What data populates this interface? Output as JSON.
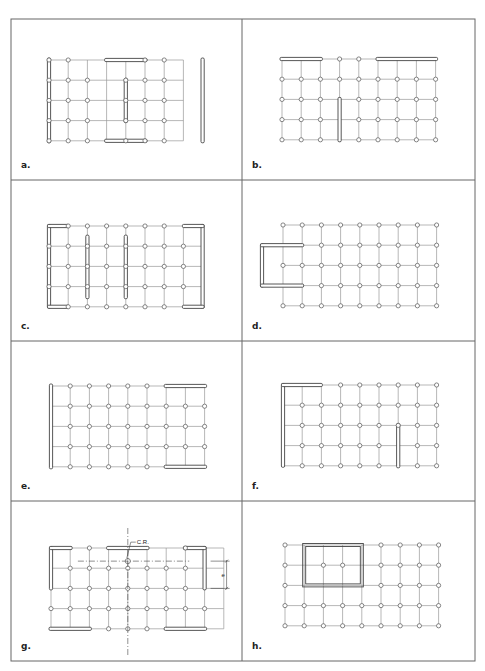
{
  "figure": {
    "border_color": "#666666",
    "grid_color": "#9a9a9a",
    "wall_color": "#444444",
    "outer": {
      "x": 11,
      "y": 19,
      "w": 464,
      "h": 642
    },
    "dividers": {
      "vertical_x": 242,
      "horizontal_y": [
        180,
        341,
        501
      ]
    },
    "grid": {
      "cols": 9,
      "rows": 5,
      "dx": 19.2,
      "dy": 20.2
    },
    "panels": [
      {
        "id": "a",
        "label": "a.",
        "x": 11,
        "y": 19,
        "w": 231,
        "h": 161,
        "origin": {
          "x": 38,
          "y": 41
        },
        "columns": [
          [
            1,
            1,
            0,
            0,
            0,
            1,
            1,
            0
          ],
          [
            1,
            1,
            1,
            0,
            1,
            1,
            1,
            0
          ],
          [
            1,
            1,
            1,
            0,
            1,
            1,
            1,
            0
          ],
          [
            1,
            1,
            1,
            0,
            1,
            1,
            1,
            0
          ],
          [
            1,
            1,
            1,
            0,
            1,
            1,
            1,
            0
          ]
        ],
        "grid_cols": 8,
        "walls": [
          {
            "type": "v",
            "c": 0,
            "r0": 0,
            "r1": 4
          },
          {
            "type": "v",
            "c": 8,
            "r0": 0,
            "r1": 4
          },
          {
            "type": "h",
            "r": 0,
            "c0": 3,
            "c1": 5
          },
          {
            "type": "h",
            "r": 4,
            "c0": 3,
            "c1": 5
          },
          {
            "type": "v",
            "c": 4,
            "r0": 1,
            "r1": 3
          }
        ],
        "grid_offset_c": 0
      },
      {
        "id": "b",
        "label": "b.",
        "x": 242,
        "y": 19,
        "w": 233,
        "h": 161,
        "origin": {
          "x": 40,
          "y": 40
        },
        "columns": [
          [
            0,
            0,
            0,
            1,
            1,
            0,
            0,
            0,
            0
          ],
          [
            1,
            1,
            1,
            1,
            1,
            1,
            1,
            1,
            1
          ],
          [
            1,
            1,
            1,
            0,
            1,
            1,
            1,
            1,
            1
          ],
          [
            1,
            1,
            1,
            0,
            1,
            1,
            1,
            1,
            1
          ],
          [
            1,
            1,
            1,
            0,
            1,
            1,
            1,
            1,
            1
          ]
        ],
        "walls": [
          {
            "type": "h",
            "r": 0,
            "c0": 0,
            "c1": 2
          },
          {
            "type": "h",
            "r": 0,
            "c0": 5,
            "c1": 8
          },
          {
            "type": "v",
            "c": 3,
            "r0": 2,
            "r1": 4
          }
        ]
      },
      {
        "id": "c",
        "label": "c.",
        "x": 11,
        "y": 180,
        "w": 231,
        "h": 161,
        "origin": {
          "x": 38,
          "y": 46
        },
        "columns": [
          [
            0,
            1,
            1,
            1,
            1,
            1,
            1,
            0,
            0
          ],
          [
            1,
            1,
            1,
            1,
            1,
            1,
            1,
            1,
            0
          ],
          [
            1,
            1,
            1,
            1,
            1,
            1,
            1,
            1,
            0
          ],
          [
            1,
            1,
            1,
            1,
            1,
            1,
            1,
            1,
            0
          ],
          [
            0,
            1,
            1,
            1,
            1,
            1,
            1,
            0,
            0
          ]
        ],
        "hide_under_walls": true,
        "walls": [
          {
            "type": "bracket-left",
            "c0": 0,
            "c1": 1,
            "r0": 0,
            "r1": 4
          },
          {
            "type": "bracket-right",
            "c0": 7,
            "c1": 8,
            "r0": 0,
            "r1": 4
          },
          {
            "type": "v",
            "c": 2,
            "r0": 0.55,
            "r1": 3.5
          },
          {
            "type": "v",
            "c": 4,
            "r0": 0.55,
            "r1": 3.5
          }
        ],
        "x_offset": 0
      },
      {
        "id": "d",
        "label": "d.",
        "x": 242,
        "y": 180,
        "w": 233,
        "h": 161,
        "origin": {
          "x": 41,
          "y": 45
        },
        "columns": [
          [
            1,
            1,
            1,
            1,
            1,
            1,
            1,
            1,
            1
          ],
          [
            0,
            0,
            1,
            1,
            1,
            1,
            1,
            1,
            1
          ],
          [
            1,
            1,
            1,
            1,
            1,
            1,
            1,
            1,
            1
          ],
          [
            0,
            0,
            1,
            1,
            1,
            1,
            1,
            1,
            1
          ],
          [
            1,
            1,
            1,
            1,
            1,
            1,
            1,
            1,
            1
          ]
        ],
        "walls": [
          {
            "type": "u-left",
            "x_left": -21,
            "c1": 1,
            "r0": 1,
            "r1": 3
          }
        ]
      },
      {
        "id": "e",
        "label": "e.",
        "x": 11,
        "y": 341,
        "w": 231,
        "h": 160,
        "origin": {
          "x": 40,
          "y": 45
        },
        "columns": [
          [
            0,
            1,
            1,
            1,
            1,
            1,
            0,
            0,
            0
          ],
          [
            0,
            1,
            1,
            1,
            1,
            1,
            1,
            1,
            1
          ],
          [
            0,
            1,
            1,
            1,
            1,
            1,
            1,
            1,
            1
          ],
          [
            0,
            1,
            1,
            1,
            1,
            1,
            1,
            1,
            1
          ],
          [
            0,
            1,
            1,
            1,
            1,
            1,
            0,
            0,
            0
          ]
        ],
        "walls": [
          {
            "type": "v",
            "c": 0,
            "r0": 0,
            "r1": 4
          },
          {
            "type": "h",
            "r": 0,
            "c0": 6,
            "c1": 8
          },
          {
            "type": "h",
            "r": 4,
            "c0": 6,
            "c1": 8
          }
        ]
      },
      {
        "id": "f",
        "label": "f.",
        "x": 242,
        "y": 341,
        "w": 233,
        "h": 160,
        "origin": {
          "x": 41,
          "y": 44
        },
        "grid_cols_count": 9,
        "columns": [
          [
            0,
            0,
            0,
            1,
            1,
            1,
            1,
            1,
            1
          ],
          [
            0,
            1,
            1,
            1,
            1,
            1,
            1,
            1,
            1
          ],
          [
            0,
            1,
            1,
            1,
            1,
            1,
            1,
            1,
            1
          ],
          [
            0,
            1,
            1,
            1,
            1,
            1,
            0,
            1,
            1
          ],
          [
            0,
            1,
            1,
            1,
            1,
            1,
            0,
            1,
            1
          ]
        ],
        "walls": [
          {
            "type": "corner-tl",
            "c0": 0,
            "c1": 2,
            "r0": 0,
            "r1": 4
          },
          {
            "type": "v",
            "c": 6,
            "r0": 2,
            "r1": 4
          }
        ]
      },
      {
        "id": "g",
        "label": "g.",
        "x": 11,
        "y": 501,
        "w": 231,
        "h": 160,
        "origin": {
          "x": 40,
          "y": 47
        },
        "columns": [
          [
            0,
            0,
            1,
            0,
            0,
            0,
            0,
            1,
            0,
            0
          ],
          [
            0,
            1,
            1,
            1,
            1,
            1,
            1,
            1,
            0,
            0
          ],
          [
            0,
            1,
            1,
            1,
            1,
            1,
            1,
            1,
            0,
            0
          ],
          [
            1,
            1,
            1,
            1,
            1,
            1,
            1,
            1,
            1,
            0
          ],
          [
            0,
            0,
            0,
            1,
            1,
            1,
            0,
            0,
            0,
            0
          ]
        ],
        "walls": [
          {
            "type": "bracket-left-top",
            "c0": 0,
            "c1": 1,
            "r0": 0,
            "r1": 2
          },
          {
            "type": "bracket-right-top",
            "c0": 7,
            "c1": 8,
            "r0": 0,
            "r1": 2
          },
          {
            "type": "h",
            "r": 0,
            "c0": 3,
            "c1": 5
          },
          {
            "type": "h",
            "r": 4,
            "c0": 0,
            "c1": 2
          },
          {
            "type": "h",
            "r": 4,
            "c0": 6,
            "c1": 8
          }
        ],
        "annotations": {
          "center_label": "C.R.",
          "dimension_label": "e",
          "cr_col": 4,
          "cr_row": 0.65
        }
      },
      {
        "id": "h",
        "label": "h.",
        "x": 242,
        "y": 501,
        "w": 233,
        "h": 160,
        "origin": {
          "x": 43,
          "y": 44
        },
        "columns": [
          [
            1,
            0,
            0,
            0,
            0,
            1,
            1,
            1,
            1
          ],
          [
            1,
            0,
            1,
            1,
            0,
            1,
            1,
            1,
            1
          ],
          [
            1,
            0,
            0,
            0,
            0,
            1,
            1,
            1,
            1
          ],
          [
            1,
            1,
            1,
            1,
            1,
            1,
            1,
            1,
            1
          ],
          [
            1,
            1,
            1,
            1,
            1,
            1,
            1,
            1,
            1
          ]
        ],
        "walls": [
          {
            "type": "rect",
            "c0": 1,
            "c1": 4,
            "r0": 0,
            "r1": 2
          }
        ]
      }
    ]
  }
}
